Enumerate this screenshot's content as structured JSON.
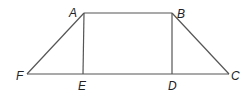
{
  "diagram": {
    "type": "geometry",
    "shape": "trapezoid with two altitudes",
    "points": {
      "A": {
        "label": "A",
        "x": 84,
        "y": 13,
        "lx": 69,
        "ly": 17
      },
      "B": {
        "label": "B",
        "x": 172,
        "y": 13,
        "lx": 177,
        "ly": 18
      },
      "C": {
        "label": "C",
        "x": 229,
        "y": 74,
        "lx": 231,
        "ly": 80
      },
      "D": {
        "label": "D",
        "x": 172,
        "y": 74,
        "lx": 168,
        "ly": 90
      },
      "E": {
        "label": "E",
        "x": 83,
        "y": 74,
        "lx": 78,
        "ly": 90
      },
      "F": {
        "label": "F",
        "x": 27,
        "y": 74,
        "lx": 16,
        "ly": 80
      }
    },
    "segments": [
      "AB",
      "BC",
      "CF",
      "FA",
      "AE",
      "BD"
    ],
    "line_color": "#555555",
    "label_color": "#222222"
  }
}
